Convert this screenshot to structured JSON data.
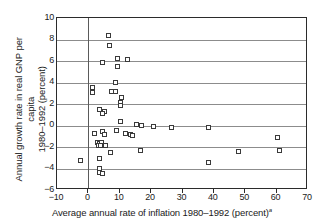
{
  "chart_data": {
    "type": "scatter",
    "title": "",
    "xlabel": "Average annual rate of inflation 1980–1992 (percent)",
    "xlabel_footnote": "a",
    "ylabel_line1": "Annual growth rate in real GNP per capita",
    "ylabel_line2": "1980–1992 (percent)",
    "xlim": [
      -10,
      70
    ],
    "ylim": [
      -6,
      10
    ],
    "xticks": [
      -10,
      0,
      10,
      20,
      30,
      40,
      50,
      60,
      70
    ],
    "xtick_labels": [
      "−10",
      "0",
      "10",
      "20",
      "30",
      "40",
      "50",
      "60",
      "70"
    ],
    "yticks": [
      10,
      8,
      6,
      4,
      2,
      0,
      -2,
      -4,
      -6
    ],
    "ytick_labels": [
      "10",
      "8",
      "6",
      "4",
      "2",
      "0",
      "−2",
      "−4",
      "−6"
    ],
    "grid": "horizontal",
    "vertical_reference_line_at_x": 0,
    "legend": null,
    "marker": "open-square",
    "points": [
      {
        "x": 6.4,
        "y": 8.4
      },
      {
        "x": 6.7,
        "y": 7.4
      },
      {
        "x": 4.4,
        "y": 5.9
      },
      {
        "x": 9.4,
        "y": 6.2
      },
      {
        "x": 12.6,
        "y": 6.1
      },
      {
        "x": 9.3,
        "y": 5.5
      },
      {
        "x": 8.8,
        "y": 4.0
      },
      {
        "x": 1.2,
        "y": 3.5
      },
      {
        "x": 7.5,
        "y": 3.2
      },
      {
        "x": 8.6,
        "y": 3.2
      },
      {
        "x": 1.4,
        "y": 3.1
      },
      {
        "x": 10.7,
        "y": 2.6
      },
      {
        "x": 10.2,
        "y": 2.1
      },
      {
        "x": 10.1,
        "y": 1.9
      },
      {
        "x": 3.6,
        "y": 1.5
      },
      {
        "x": 5.2,
        "y": 1.3
      },
      {
        "x": 4.6,
        "y": 1.1
      },
      {
        "x": 10.1,
        "y": 0.4
      },
      {
        "x": 15.2,
        "y": 0.1
      },
      {
        "x": 16.8,
        "y": 0.0
      },
      {
        "x": 20.8,
        "y": -0.1
      },
      {
        "x": 26.6,
        "y": -0.2
      },
      {
        "x": 38.2,
        "y": -0.2
      },
      {
        "x": 2.0,
        "y": -0.7
      },
      {
        "x": 4.6,
        "y": -0.6
      },
      {
        "x": 5.1,
        "y": -0.8
      },
      {
        "x": 9.0,
        "y": -0.5
      },
      {
        "x": 11.8,
        "y": -0.7
      },
      {
        "x": 13.3,
        "y": -0.8
      },
      {
        "x": 14.2,
        "y": -0.9
      },
      {
        "x": 3.0,
        "y": -1.6
      },
      {
        "x": 3.6,
        "y": -1.7
      },
      {
        "x": 4.1,
        "y": -1.6
      },
      {
        "x": 3.3,
        "y": -1.9
      },
      {
        "x": 4.0,
        "y": -1.9
      },
      {
        "x": 5.4,
        "y": -1.9
      },
      {
        "x": 60.3,
        "y": -1.1
      },
      {
        "x": 60.8,
        "y": -2.3
      },
      {
        "x": 7.2,
        "y": -2.5
      },
      {
        "x": 16.6,
        "y": -2.3
      },
      {
        "x": 48.0,
        "y": -2.4
      },
      {
        "x": -2.4,
        "y": -3.3
      },
      {
        "x": 3.4,
        "y": -3.1
      },
      {
        "x": 3.5,
        "y": -4.0
      },
      {
        "x": 3.6,
        "y": -4.4
      },
      {
        "x": 4.4,
        "y": -4.5
      },
      {
        "x": 38.4,
        "y": -3.4
      }
    ]
  }
}
